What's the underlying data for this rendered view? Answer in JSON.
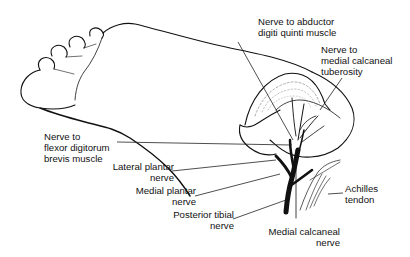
{
  "figure": {
    "line_color": "#111111",
    "shade_color": "#9a9a9a",
    "background": "#ffffff"
  },
  "labels": {
    "abductor_digiti_quinti": "Nerve to abductor\ndigiti quinti muscle",
    "medial_calcaneal_tuberosity": "Nerve to\nmedial calcaneal\ntuberosity",
    "flexor_digitorum_brevis": "Nerve to\nflexor digitorum\nbrevis muscle",
    "lateral_plantar": "Lateral plantar\nnerve",
    "medial_plantar": "Medial plantar\nnerve",
    "posterior_tibial": "Posterior tibial\nnerve",
    "achilles": "Achilles\ntendon",
    "medial_calcaneal": "Medial calcaneal\nnerve"
  }
}
